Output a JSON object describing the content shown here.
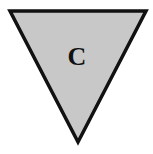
{
  "shape": {
    "type": "inverted-triangle",
    "label": "C",
    "fill_color": "#c8c8c8",
    "stroke_color": "#111111",
    "points": [
      [
        10,
        11
      ],
      [
        146,
        11
      ],
      [
        78,
        142
      ]
    ]
  }
}
